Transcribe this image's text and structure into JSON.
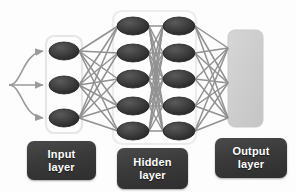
{
  "diagram": {
    "background_color": "#fdfdfd",
    "node_color": "#3a3a3a",
    "node_edge_color": "#1f1f1f",
    "connection_color": "#8c8c8c",
    "group_box_color": "#e8e8e8",
    "output_block_color": "#cfcfcf",
    "label_box_color": "#3c3c3c",
    "label_text_color": "#ffffff"
  },
  "layers": [
    {
      "id": "input",
      "label_line1": "Input",
      "label_line2": "layer",
      "node_count": 3,
      "columns": 1,
      "nodes": [
        {
          "cx": 64,
          "cy": 51,
          "rx": 15,
          "ry": 9
        },
        {
          "cx": 64,
          "cy": 85,
          "rx": 15,
          "ry": 9
        },
        {
          "cx": 64,
          "cy": 118,
          "rx": 15,
          "ry": 9
        }
      ],
      "box": {
        "x": 46,
        "y": 36,
        "width": 36,
        "height": 97
      }
    },
    {
      "id": "hidden",
      "label_line1": "Hidden",
      "label_line2": "layer",
      "node_count": 10,
      "columns": 2,
      "nodes": [
        {
          "cx": 133,
          "cy": 26,
          "rx": 16,
          "ry": 9
        },
        {
          "cx": 133,
          "cy": 53,
          "rx": 16,
          "ry": 9
        },
        {
          "cx": 133,
          "cy": 79,
          "rx": 16,
          "ry": 9
        },
        {
          "cx": 133,
          "cy": 106,
          "rx": 16,
          "ry": 9
        },
        {
          "cx": 133,
          "cy": 131,
          "rx": 16,
          "ry": 9
        },
        {
          "cx": 179,
          "cy": 26,
          "rx": 16,
          "ry": 9
        },
        {
          "cx": 179,
          "cy": 53,
          "rx": 16,
          "ry": 9
        },
        {
          "cx": 179,
          "cy": 79,
          "rx": 16,
          "ry": 9
        },
        {
          "cx": 179,
          "cy": 106,
          "rx": 16,
          "ry": 9
        },
        {
          "cx": 179,
          "cy": 131,
          "rx": 16,
          "ry": 9
        }
      ],
      "box": {
        "x": 113,
        "y": 11,
        "width": 83,
        "height": 133
      }
    },
    {
      "id": "output",
      "label_line1": "Output",
      "label_line2": "layer",
      "node_count": 0,
      "columns": 1,
      "nodes": [],
      "box": {
        "x": 228,
        "y": 30,
        "width": 35,
        "height": 97
      },
      "terminals": [
        {
          "x": 228,
          "y": 48
        },
        {
          "x": 228,
          "y": 83
        },
        {
          "x": 228,
          "y": 118
        }
      ]
    }
  ],
  "input_arrows": {
    "origin": {
      "x": 8,
      "y": 85
    },
    "count": 3,
    "targets": [
      {
        "x": 45,
        "y": 51
      },
      {
        "x": 45,
        "y": 85
      },
      {
        "x": 45,
        "y": 118
      }
    ],
    "color": "#9a9a9a"
  }
}
